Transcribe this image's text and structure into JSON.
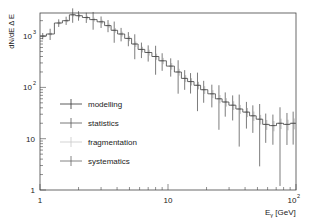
{
  "chart_data": {
    "type": "line",
    "subtype": "step-histogram-with-error-bars",
    "title": "",
    "xlabel": "E_γ [GeV]",
    "ylabel": "dN/dE Δ E",
    "xscale": "log",
    "yscale": "log",
    "xlim": [
      1,
      100
    ],
    "ylim": [
      1,
      2800
    ],
    "x_ticks": [
      "1",
      "10",
      "10²"
    ],
    "y_ticks": [
      "1",
      "10",
      "10²",
      "10³"
    ],
    "grid": false,
    "legend_position": "lower-left",
    "legend": [
      "modelling",
      "statistics",
      "fragmentation",
      "systematics"
    ],
    "x": [
      1.05,
      1.2,
      1.4,
      1.6,
      1.8,
      2.0,
      2.3,
      2.6,
      3.0,
      3.4,
      3.8,
      4.3,
      4.9,
      5.5,
      6.2,
      7.0,
      8.0,
      9.0,
      10.5,
      12,
      13.5,
      15,
      17,
      19,
      22,
      25,
      28,
      32,
      36,
      41,
      46,
      52,
      58,
      66,
      75,
      85,
      95
    ],
    "series": [
      {
        "name": "spectrum",
        "values": [
          1000,
          1100,
          1800,
          2000,
          2600,
          2500,
          2300,
          2100,
          1900,
          1600,
          1300,
          1100,
          900,
          700,
          550,
          480,
          400,
          330,
          260,
          200,
          150,
          130,
          110,
          90,
          75,
          60,
          52,
          45,
          38,
          33,
          28,
          24,
          19,
          18,
          20,
          19,
          20
        ]
      }
    ],
    "error_bands": {
      "modelling": {
        "color": "#333333"
      },
      "statistics": {
        "color": "#555555"
      },
      "fragmentation": {
        "color": "#cccccc"
      },
      "systematics": {
        "color": "#777777"
      }
    }
  },
  "axes": {
    "xlabel_main": "E",
    "xlabel_sub": "γ",
    "xlabel_unit": " [GeV]",
    "ylabel": "dN/dE Δ E",
    "x_tick_labels": {
      "t1": "1",
      "t10": "10",
      "t100_base": "10",
      "t100_exp": "2"
    },
    "y_tick_labels": {
      "t1": "1",
      "t10": "10",
      "t100_base": "10",
      "t100_exp": "2",
      "t1000_base": "10",
      "t1000_exp": "3"
    }
  },
  "legend": {
    "items": [
      {
        "label": "modelling",
        "color": "#333333"
      },
      {
        "label": "statistics",
        "color": "#555555"
      },
      {
        "label": "fragmentation",
        "color": "#c8c8c8"
      },
      {
        "label": "systematics",
        "color": "#666666"
      }
    ]
  }
}
